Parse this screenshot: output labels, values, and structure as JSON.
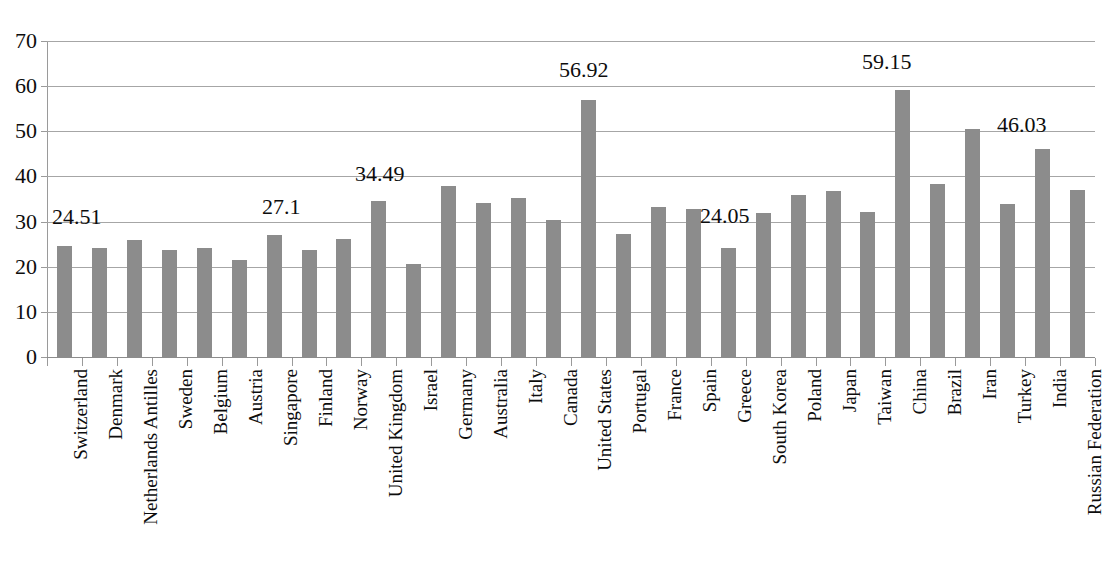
{
  "chart": {
    "title": "",
    "bar_color": "#8c8c8c",
    "gridline_color": "#a6a6a6",
    "axis_color": "#9a9a9a",
    "text_color": "#0d0d0d"
  },
  "chart_data": {
    "type": "bar",
    "title": "",
    "xlabel": "",
    "ylabel": "",
    "ylim": [
      0,
      70
    ],
    "yticks": [
      0,
      10,
      20,
      30,
      40,
      50,
      60,
      70
    ],
    "grid": true,
    "legend": null,
    "categories": [
      "Switzerland",
      "Denmark",
      "Netherlands Antilles",
      "Sweden",
      "Belgium",
      "Austria",
      "Singapore",
      "Finland",
      "Norway",
      "United Kingdom",
      "Israel",
      "Germany",
      "Australia",
      "Italy",
      "Canada",
      "United States",
      "Portugal",
      "France",
      "Spain",
      "Greece",
      "South Korea",
      "Poland",
      "Japan",
      "Taiwan",
      "China",
      "Brazil",
      "Iran",
      "Turkey",
      "India",
      "Russian Federation"
    ],
    "values": [
      24.51,
      24.1,
      25.9,
      23.7,
      24.1,
      21.4,
      27.1,
      23.6,
      26.2,
      34.49,
      20.5,
      37.9,
      34.1,
      35.3,
      30.3,
      56.92,
      27.2,
      33.3,
      32.8,
      24.05,
      31.8,
      35.9,
      36.8,
      32.2,
      59.15,
      38.3,
      50.6,
      33.9,
      46.03,
      36.9
    ],
    "annotations": [
      {
        "category": "Switzerland",
        "text": "24.51",
        "x_px": 52,
        "y_px": 206
      },
      {
        "category": "Singapore",
        "text": "27.1",
        "x_px": 262,
        "y_px": 196
      },
      {
        "category": "United Kingdom",
        "text": "34.49",
        "x_px": 355,
        "y_px": 163
      },
      {
        "category": "United States",
        "text": "56.92",
        "x_px": 559,
        "y_px": 59
      },
      {
        "category": "Greece",
        "text": "24.05",
        "x_px": 700,
        "y_px": 205
      },
      {
        "category": "China",
        "text": "59.15",
        "x_px": 862,
        "y_px": 51
      },
      {
        "category": "India",
        "text": "46.03",
        "x_px": 997,
        "y_px": 114
      }
    ]
  }
}
